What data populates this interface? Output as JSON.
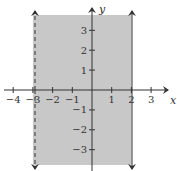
{
  "chart_data": {
    "type": "area",
    "title": "",
    "xlabel": "x",
    "ylabel": "y",
    "xlim": [
      -4.5,
      4
    ],
    "ylim": [
      -3.8,
      3.8
    ],
    "grid": false,
    "x_ticks": [
      -4,
      -3,
      -2,
      -1,
      1,
      2,
      3
    ],
    "y_ticks": [
      -3,
      -2,
      -1,
      1,
      2,
      3
    ],
    "x_tick_labels": [
      "−4",
      "−3",
      "−2",
      "−1",
      "1",
      "2",
      "3"
    ],
    "y_tick_labels": [
      "−3",
      "−2",
      "−1",
      "1",
      "2",
      "3"
    ],
    "boundaries": [
      {
        "x": -3,
        "style": "dashed",
        "inclusive": false,
        "arrows": "both"
      },
      {
        "x": 2,
        "style": "solid",
        "inclusive": true,
        "arrows": "both"
      }
    ],
    "shaded_region": {
      "x_min": -3,
      "x_max": 2,
      "color": "#c8c8c8"
    },
    "inequality": "-3 < x ≤ 2"
  },
  "colors": {
    "shade": "#c8c8c8",
    "axis": "#333333",
    "boundary": "#333333"
  },
  "axes": {
    "x_label": "x",
    "y_label": "y"
  }
}
